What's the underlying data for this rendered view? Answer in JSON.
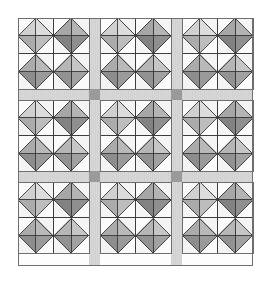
{
  "figure": {
    "kind": "quilt-layout-diagram",
    "canvas": {
      "width": 271,
      "height": 281,
      "background": "#ffffff"
    }
  },
  "layout": {
    "quilt_origin_x": 18,
    "quilt_origin_y": 18,
    "quilt_width": 235,
    "quilt_height": 248,
    "block_rows": 3,
    "block_cols": 3,
    "block_size": 71,
    "units_per_block_row": 2,
    "units_per_block_col": 2,
    "unit_size": 35.5,
    "sashing_width": 11,
    "sashing_positions_x": [
      89,
      171
    ],
    "sashing_positions_y": [
      89,
      171
    ],
    "border_stroke_width": 1
  },
  "colors": {
    "background": "#ffffff",
    "outer_border": "#6e6e6e",
    "block_border": "#6e6e6e",
    "sashing": "#d8d8d8",
    "sashing_stripe": "#cfcfcf",
    "cornerstone": "#9a9a9a",
    "patch_outline": "#3c3c3c",
    "corner_light": "#fbfbfb",
    "corner_light_alt": "#f2f2f2",
    "diamond_very_light": "#dedede",
    "diamond_light": "#cbcbcb",
    "diamond_mid": "#a8a8a8",
    "diamond_dark": "#8e8e8e",
    "diamond_darker": "#7d7d7d"
  },
  "patch_palette": {
    "corner_nw": "#fbfbfb",
    "corner_ne": "#f4f4f4",
    "corner_sw": "#f4f4f4",
    "corner_se": "#fbfbfb",
    "diamond_n": "#d3d3d3",
    "diamond_w": "#c2c2c2",
    "diamond_e": "#9d9d9d",
    "diamond_s": "#8c8c8c"
  },
  "unit_shading": {
    "description": "Per-unit multiplier applied to the four diamond triangles; index order is [north, west, east, south] within each square-in-a-square unit.",
    "units": [
      {
        "pos": "top-left",
        "fills": [
          "#dcdcdc",
          "#d0d0d0",
          "#bdbdbd",
          "#ababab"
        ]
      },
      {
        "pos": "top-right",
        "fills": [
          "#b4b4b4",
          "#a6a6a6",
          "#8f8f8f",
          "#828282"
        ]
      },
      {
        "pos": "bottom-left",
        "fills": [
          "#b9b9b9",
          "#ababab",
          "#9a9a9a",
          "#8d8d8d"
        ]
      },
      {
        "pos": "bottom-right",
        "fills": [
          "#c6c6c6",
          "#b6b6b6",
          "#a1a1a1",
          "#929292"
        ]
      }
    ]
  },
  "blocks": [
    {
      "row": 0,
      "col": 0,
      "name": "block-r1c1"
    },
    {
      "row": 0,
      "col": 1,
      "name": "block-r1c2"
    },
    {
      "row": 0,
      "col": 2,
      "name": "block-r1c3"
    },
    {
      "row": 1,
      "col": 0,
      "name": "block-r2c1"
    },
    {
      "row": 1,
      "col": 1,
      "name": "block-r2c2"
    },
    {
      "row": 1,
      "col": 2,
      "name": "block-r2c3"
    },
    {
      "row": 2,
      "col": 0,
      "name": "block-r3c1"
    },
    {
      "row": 2,
      "col": 1,
      "name": "block-r3c2"
    },
    {
      "row": 2,
      "col": 2,
      "name": "block-r3c3"
    }
  ],
  "cornerstones": [
    {
      "x": 89,
      "y": 89
    },
    {
      "x": 171,
      "y": 89
    },
    {
      "x": 89,
      "y": 171
    },
    {
      "x": 171,
      "y": 171
    }
  ],
  "chart_data": {
    "type": "table",
    "categories": [
      "block-r1c1",
      "block-r1c2",
      "block-r1c3",
      "block-r2c1",
      "block-r2c2",
      "block-r2c3",
      "block-r3c1",
      "block-r3c2",
      "block-r3c3"
    ],
    "values": [
      4,
      4,
      4,
      4,
      4,
      4,
      4,
      4,
      4
    ],
    "xlabel": "block",
    "ylabel": "square-in-a-square units per block",
    "legend": [
      "light patch",
      "medium patch",
      "dark patch",
      "sashing",
      "cornerstone"
    ],
    "grid": false
  }
}
